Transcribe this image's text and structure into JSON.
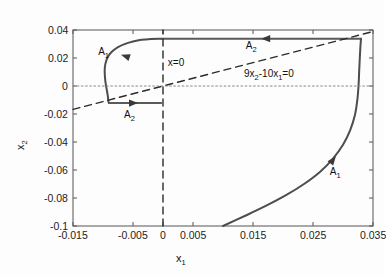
{
  "chart_data": {
    "type": "line",
    "title": "",
    "xlabel": "x1",
    "ylabel": "x2",
    "xlim": [
      -0.015,
      0.035
    ],
    "ylim": [
      -0.1,
      0.04
    ],
    "grid": false,
    "legend_position": "none",
    "xticks": [
      "-0.015",
      "-0.005",
      "0",
      "0.005",
      "0.015",
      "0.025",
      "0.035"
    ],
    "xtick_values": [
      -0.015,
      -0.005,
      0,
      0.005,
      0.015,
      0.025,
      0.035
    ],
    "yticks": [
      "0.04",
      "0.02",
      "0",
      "-0.02",
      "-0.04",
      "-0.06",
      "-0.08",
      "-0.1"
    ],
    "ytick_values": [
      0.04,
      0.02,
      0,
      -0.02,
      -0.04,
      -0.06,
      -0.08,
      -0.1
    ],
    "series": [
      {
        "name": "A1-upper-left-arc",
        "style": "solid",
        "color": "#4d4d4d",
        "points": [
          [
            -0.0003,
            0.0338
          ],
          [
            -0.002,
            0.0336
          ],
          [
            -0.0036,
            0.033
          ],
          [
            -0.005,
            0.0318
          ],
          [
            -0.0063,
            0.0301
          ],
          [
            -0.0075,
            0.0278
          ],
          [
            -0.0084,
            0.025
          ],
          [
            -0.0091,
            0.0215
          ],
          [
            -0.0095,
            0.0175
          ],
          [
            -0.0097,
            0.013
          ],
          [
            -0.0097,
            0.0082
          ],
          [
            -0.0096,
            0.0032
          ],
          [
            -0.0094,
            -0.002
          ],
          [
            -0.0092,
            -0.007
          ],
          [
            -0.0091,
            -0.011
          ],
          [
            -0.009,
            -0.0122
          ]
        ]
      },
      {
        "name": "A2-upper-horizontal",
        "style": "solid",
        "color": "#5a5a5a",
        "points": [
          [
            0.033,
            0.0338
          ],
          [
            -0.0003,
            0.0338
          ]
        ]
      },
      {
        "name": "A2-lower-horizontal",
        "style": "solid",
        "color": "#5a5a5a",
        "points": [
          [
            -0.009,
            -0.0122
          ],
          [
            -0.0003,
            -0.0122
          ]
        ]
      },
      {
        "name": "A1-right-arc",
        "style": "solid",
        "color": "#4d4d4d",
        "points": [
          [
            0.01,
            -0.1
          ],
          [
            0.0138,
            -0.0925
          ],
          [
            0.0172,
            -0.0855
          ],
          [
            0.0205,
            -0.078
          ],
          [
            0.0235,
            -0.07
          ],
          [
            0.0262,
            -0.0612
          ],
          [
            0.0283,
            -0.052
          ],
          [
            0.03,
            -0.042
          ],
          [
            0.0312,
            -0.0315
          ],
          [
            0.032,
            -0.0205
          ],
          [
            0.0324,
            -0.0095
          ],
          [
            0.0326,
            0.001
          ],
          [
            0.0327,
            0.011
          ],
          [
            0.0328,
            0.02
          ],
          [
            0.0329,
            0.028
          ],
          [
            0.033,
            0.0338
          ]
        ]
      },
      {
        "name": "switching-line-9x2-10x1",
        "style": "dashed",
        "color": "#2b2b2b",
        "points": [
          [
            -0.015,
            -0.01667
          ],
          [
            0.035,
            0.03889
          ]
        ],
        "equation": "9x2-10x1=0"
      },
      {
        "name": "x-equals-0-vertical",
        "style": "dashed",
        "color": "#2b2b2b",
        "points": [
          [
            0,
            -0.1
          ],
          [
            0,
            0.04
          ]
        ],
        "equation": "x=0"
      },
      {
        "name": "zero-horizontal-axis",
        "style": "dotted",
        "color": "#8a8a8a",
        "points": [
          [
            -0.015,
            0
          ],
          [
            0.035,
            0
          ]
        ]
      }
    ],
    "annotations": [
      {
        "name": "A1-upper-left",
        "text": "A1",
        "x": -0.0108,
        "y": 0.0238
      },
      {
        "name": "A2-upper",
        "text": "A2",
        "x": 0.0138,
        "y": 0.0278
      },
      {
        "name": "A2-lower",
        "text": "A2",
        "x": -0.0065,
        "y": -0.0215
      },
      {
        "name": "A1-lower-right",
        "text": "A1",
        "x": 0.0278,
        "y": -0.062
      },
      {
        "name": "x-equals-zero",
        "text": "x=0",
        "x": 0.0008,
        "y": 0.0168
      },
      {
        "name": "switching-eq",
        "text": "9x2-10x1=0",
        "x": 0.0135,
        "y": 0.0082
      }
    ],
    "arrows": [
      {
        "name": "arrow-A1-upper-left",
        "x": -0.0062,
        "y": 0.0212,
        "direction": "down-left"
      },
      {
        "name": "arrow-A2-upper",
        "x": 0.0172,
        "y": 0.0338,
        "direction": "left"
      },
      {
        "name": "arrow-A2-lower",
        "x": -0.005,
        "y": -0.0122,
        "direction": "right"
      },
      {
        "name": "arrow-A1-lower-right",
        "x": 0.0283,
        "y": -0.053,
        "direction": "up-right"
      }
    ]
  },
  "labels": {
    "xaxis_main": "x",
    "xaxis_sub": "1",
    "yaxis_main": "x",
    "yaxis_sub": "2"
  }
}
